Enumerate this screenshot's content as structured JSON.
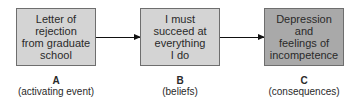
{
  "diagram": {
    "type": "flow",
    "colors": {
      "box_light": "#d4d4d4",
      "box_dark": "#a9a9a9",
      "border": "#6e6e6e",
      "arrow": "#111111"
    },
    "nodes": [
      {
        "id": "A",
        "text": "Letter of\nrejection\nfrom graduate\nschool",
        "letter": "A",
        "caption": "(activating event)"
      },
      {
        "id": "B",
        "text": "I must\nsucceed at\neverything\nI do",
        "letter": "B",
        "caption": "(beliefs)"
      },
      {
        "id": "C",
        "text": "Depression\nand\nfeelings of\nincompetence",
        "letter": "C",
        "caption": "(consequences)"
      }
    ],
    "edges": [
      {
        "from": "A",
        "to": "B"
      },
      {
        "from": "B",
        "to": "C"
      }
    ]
  }
}
